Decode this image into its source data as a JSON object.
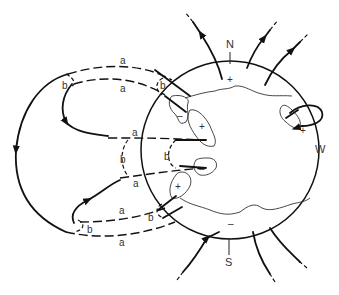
{
  "diagram": {
    "labels": {
      "north": "N",
      "south": "S",
      "west": "W",
      "plus": "+",
      "minus": "–"
    },
    "loop_labels": {
      "a1": "a",
      "a2": "a",
      "a3": "a",
      "a4": "a",
      "a5": "a",
      "a6": "a",
      "b1": "b",
      "b2": "b",
      "b3": "b",
      "b4": "b",
      "b5": "b",
      "b6": "b"
    },
    "colors": {
      "line": "#111111",
      "text": "#333333",
      "background": "#ffffff"
    }
  }
}
